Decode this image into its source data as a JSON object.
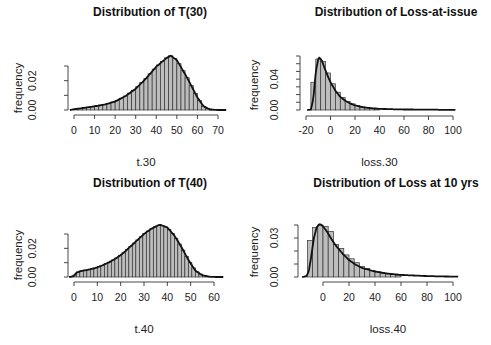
{
  "chart_data": [
    {
      "type": "bar",
      "subtype": "histogram+density",
      "title": "Distribution of T(30)",
      "xlabel": "t.30",
      "ylabel": "frequency",
      "xticks": [
        0,
        10,
        20,
        30,
        40,
        50,
        60,
        70
      ],
      "yticks": [
        0.0,
        0.01,
        0.02,
        0.03
      ],
      "ytick_labels": [
        "0.00",
        "0.02"
      ],
      "xlim": [
        -2,
        74
      ],
      "ylim": [
        0,
        0.038
      ],
      "bin_width": 2,
      "density_peak": {
        "x": 47,
        "y": 0.037
      },
      "density": {
        "x": [
          -2,
          0,
          5,
          10,
          15,
          20,
          25,
          30,
          35,
          40,
          45,
          47,
          50,
          55,
          60,
          63,
          66,
          70,
          74
        ],
        "y": [
          0.0,
          0.0005,
          0.0015,
          0.0025,
          0.0038,
          0.0058,
          0.0095,
          0.0145,
          0.0215,
          0.0295,
          0.0355,
          0.037,
          0.034,
          0.022,
          0.0085,
          0.0025,
          0.0004,
          0.0,
          0.0
        ]
      }
    },
    {
      "type": "bar",
      "subtype": "histogram+density",
      "title": "Distribution of Loss-at-issue",
      "xlabel": "loss.30",
      "ylabel": "frequency",
      "xticks": [
        -20,
        0,
        20,
        40,
        60,
        80,
        100
      ],
      "yticks": [
        0.0,
        0.01,
        0.02,
        0.03,
        0.04,
        0.05,
        0.06,
        0.07
      ],
      "ytick_labels": [
        "0.00",
        "0.04"
      ],
      "xlim": [
        -20,
        100
      ],
      "ylim": [
        0,
        0.07
      ],
      "bin_width": 4,
      "bins": [
        {
          "x0": -16,
          "x1": -12,
          "y": 0.036
        },
        {
          "x0": -12,
          "x1": -8,
          "y": 0.066
        },
        {
          "x0": -8,
          "x1": -4,
          "y": 0.063
        },
        {
          "x0": -4,
          "x1": 0,
          "y": 0.048
        },
        {
          "x0": 0,
          "x1": 4,
          "y": 0.034
        },
        {
          "x0": 4,
          "x1": 8,
          "y": 0.023
        },
        {
          "x0": 8,
          "x1": 12,
          "y": 0.016
        },
        {
          "x0": 12,
          "x1": 16,
          "y": 0.011
        },
        {
          "x0": 16,
          "x1": 20,
          "y": 0.008
        },
        {
          "x0": 20,
          "x1": 24,
          "y": 0.006
        },
        {
          "x0": 24,
          "x1": 28,
          "y": 0.004
        },
        {
          "x0": 28,
          "x1": 32,
          "y": 0.003
        },
        {
          "x0": 32,
          "x1": 36,
          "y": 0.002
        },
        {
          "x0": 36,
          "x1": 40,
          "y": 0.0015
        }
      ],
      "density_peak": {
        "x": -9,
        "y": 0.068
      },
      "density": {
        "x": [
          -19,
          -16,
          -14,
          -12,
          -10,
          -9,
          -7,
          -5,
          -2,
          0,
          4,
          8,
          12,
          16,
          20,
          25,
          30,
          40,
          50,
          60,
          80,
          102
        ],
        "y": [
          0.0,
          0.0005,
          0.015,
          0.05,
          0.066,
          0.068,
          0.064,
          0.055,
          0.043,
          0.036,
          0.025,
          0.017,
          0.012,
          0.0085,
          0.006,
          0.004,
          0.0028,
          0.0015,
          0.001,
          0.0007,
          0.0004,
          0.0002
        ]
      }
    },
    {
      "type": "bar",
      "subtype": "histogram+density",
      "title": "Distribution of T(40)",
      "xlabel": "t.40",
      "ylabel": "frequency",
      "xticks": [
        0,
        10,
        20,
        30,
        40,
        50,
        60
      ],
      "yticks": [
        0.0,
        0.01,
        0.02,
        0.03
      ],
      "ytick_labels": [
        "0.00",
        "0.02"
      ],
      "xlim": [
        -2,
        64
      ],
      "ylim": [
        0,
        0.038
      ],
      "bin_width": 1.5,
      "density_peak": {
        "x": 37,
        "y": 0.0365
      },
      "density": {
        "x": [
          -2,
          0,
          1,
          3,
          6,
          9,
          12,
          15,
          18,
          21,
          24,
          27,
          30,
          33,
          36,
          37,
          40,
          43,
          46,
          49,
          52,
          55,
          58,
          61,
          64
        ],
        "y": [
          0.0,
          0.0008,
          0.003,
          0.0042,
          0.005,
          0.0062,
          0.008,
          0.0102,
          0.013,
          0.0165,
          0.021,
          0.0255,
          0.03,
          0.0335,
          0.036,
          0.0365,
          0.0345,
          0.029,
          0.021,
          0.012,
          0.0045,
          0.0012,
          0.0002,
          0.0,
          0.0
        ]
      }
    },
    {
      "type": "bar",
      "subtype": "histogram+density",
      "title": "Distribution of Loss at 10 yrs",
      "xlabel": "loss.40",
      "ylabel": "frequency",
      "xticks": [
        0,
        20,
        40,
        60,
        80,
        100
      ],
      "yticks": [
        0.0,
        0.01,
        0.02,
        0.03,
        0.04
      ],
      "ytick_labels": [
        "0.00",
        "0.03"
      ],
      "xlim": [
        -20,
        104
      ],
      "ylim": [
        0,
        0.04
      ],
      "bin_width": 4,
      "bins": [
        {
          "x0": -12,
          "x1": -8,
          "y": 0.028
        },
        {
          "x0": -8,
          "x1": -4,
          "y": 0.038
        },
        {
          "x0": -4,
          "x1": 0,
          "y": 0.04
        },
        {
          "x0": 0,
          "x1": 4,
          "y": 0.039
        },
        {
          "x0": 4,
          "x1": 8,
          "y": 0.035
        },
        {
          "x0": 8,
          "x1": 12,
          "y": 0.025
        },
        {
          "x0": 12,
          "x1": 16,
          "y": 0.022
        },
        {
          "x0": 16,
          "x1": 20,
          "y": 0.017
        },
        {
          "x0": 20,
          "x1": 24,
          "y": 0.014
        },
        {
          "x0": 24,
          "x1": 28,
          "y": 0.011
        },
        {
          "x0": 28,
          "x1": 32,
          "y": 0.008
        },
        {
          "x0": 32,
          "x1": 36,
          "y": 0.0065
        },
        {
          "x0": 36,
          "x1": 40,
          "y": 0.005
        },
        {
          "x0": 40,
          "x1": 44,
          "y": 0.004
        },
        {
          "x0": 44,
          "x1": 48,
          "y": 0.003
        },
        {
          "x0": 48,
          "x1": 52,
          "y": 0.0025
        },
        {
          "x0": 52,
          "x1": 56,
          "y": 0.002
        },
        {
          "x0": 56,
          "x1": 60,
          "y": 0.0015
        }
      ],
      "density_peak": {
        "x": -2,
        "y": 0.0405
      },
      "density": {
        "x": [
          -16,
          -13,
          -11,
          -9,
          -7,
          -5,
          -3,
          -2,
          0,
          3,
          6,
          10,
          15,
          20,
          25,
          30,
          40,
          50,
          60,
          80,
          104
        ],
        "y": [
          0.0,
          0.0005,
          0.004,
          0.016,
          0.03,
          0.038,
          0.0405,
          0.0405,
          0.039,
          0.035,
          0.03,
          0.024,
          0.018,
          0.013,
          0.0095,
          0.007,
          0.0042,
          0.0026,
          0.0016,
          0.0007,
          0.0002
        ]
      }
    }
  ],
  "panels": [
    {
      "title": "Distribution of T(30)",
      "ylabel": "frequency",
      "xlabel": "t.30",
      "xtick_labels": [
        "0",
        "10",
        "20",
        "30",
        "40",
        "50",
        "60",
        "70"
      ],
      "ytick_labels": [
        "0.00",
        "0.02"
      ]
    },
    {
      "title": "Distribution of Loss-at-issue",
      "ylabel": "frequency",
      "xlabel": "loss.30",
      "xtick_labels": [
        "-20",
        "0",
        "20",
        "40",
        "60",
        "80",
        "100"
      ],
      "ytick_labels": [
        "0.00",
        "0.04"
      ]
    },
    {
      "title": "Distribution of T(40)",
      "ylabel": "frequency",
      "xlabel": "t.40",
      "xtick_labels": [
        "0",
        "10",
        "20",
        "30",
        "40",
        "50",
        "60"
      ],
      "ytick_labels": [
        "0.00",
        "0.02"
      ]
    },
    {
      "title": "Distribution of Loss at 10 yrs",
      "ylabel": "frequency",
      "xlabel": "loss.40",
      "xtick_labels": [
        "0",
        "20",
        "40",
        "60",
        "80",
        "100"
      ],
      "ytick_labels": [
        "0.00",
        "0.03"
      ]
    }
  ],
  "colors": {
    "bar_fill": "#bdbdbd",
    "bar_edge": "#333333",
    "curve": "#111111",
    "background": "#ffffff"
  }
}
